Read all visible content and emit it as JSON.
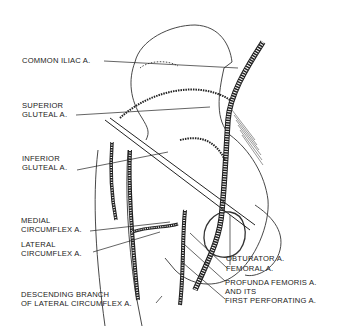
{
  "diagram": {
    "labels": {
      "common_iliac": "COMMON ILIAC A.",
      "superior_gluteal_1": "SUPERIOR",
      "superior_gluteal_2": "GLUTEAL A.",
      "inferior_gluteal_1": "INFERIOR",
      "inferior_gluteal_2": "GLUTEAL A.",
      "medial_circumflex_1": "MEDIAL",
      "medial_circumflex_2": "CIRCUMFLEX A.",
      "lateral_circumflex_1": "LATERAL",
      "lateral_circumflex_2": "CIRCUMFLEX A.",
      "descending_branch_1": "DESCENDING BRANCH",
      "descending_branch_2": "OF LATERAL CIRCUMFLEX A.",
      "obturator": "OBTURATOR A.",
      "femoral": "FEMORAL A.",
      "profunda_1": "PROFUNDA FEMORIS A.",
      "profunda_2": "AND ITS",
      "profunda_3": "FIRST PERFORATING A."
    },
    "colors": {
      "ink": "#222222",
      "background": "#ffffff"
    }
  }
}
